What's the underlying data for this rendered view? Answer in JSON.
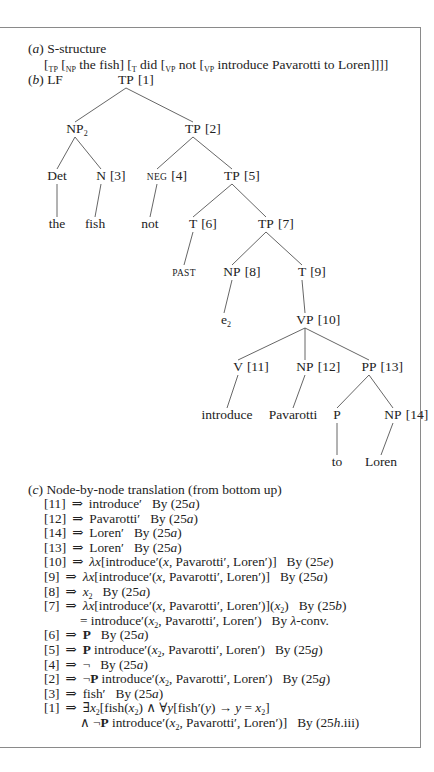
{
  "section_a": {
    "label": "(a)",
    "title": "S-structure",
    "bracketing": {
      "open_tp": "[",
      "tp_label": "TP",
      "np_label": "NP",
      "np_text": "the fish]",
      "t_label": "T",
      "t_text": "did",
      "vp1_label": "VP",
      "vp1_text": "not",
      "vp2_label": "VP",
      "vp2_text": "introduce Pavarotti to Loren]]]]"
    }
  },
  "section_b": {
    "label": "(b)",
    "title": "LF",
    "tree": {
      "nodes": [
        {
          "id": "tp1",
          "cat": "TP",
          "idx": "[1]",
          "x": 126,
          "y": 72
        },
        {
          "id": "np2",
          "cat": "NP",
          "sub": "2",
          "idx": "",
          "x": 75,
          "y": 121
        },
        {
          "id": "tp2",
          "cat": "TP",
          "idx": "[2]",
          "x": 193,
          "y": 121
        },
        {
          "id": "det",
          "cat": "Det",
          "idx": "",
          "x": 57,
          "y": 168
        },
        {
          "id": "n3",
          "cat": "N",
          "idx": "[3]",
          "x": 101,
          "y": 168
        },
        {
          "id": "neg4",
          "cat": "NEG",
          "idx": "[4]",
          "x": 157,
          "y": 168,
          "smallcaps": true
        },
        {
          "id": "tp5",
          "cat": "TP",
          "idx": "[5]",
          "x": 232,
          "y": 168
        },
        {
          "id": "the",
          "cat": "the",
          "idx": "",
          "x": 57,
          "y": 216
        },
        {
          "id": "fish",
          "cat": "fish",
          "idx": "",
          "x": 95,
          "y": 216
        },
        {
          "id": "not",
          "cat": "not",
          "idx": "",
          "x": 150,
          "y": 216
        },
        {
          "id": "t6",
          "cat": "T",
          "idx": "[6]",
          "x": 193,
          "y": 216
        },
        {
          "id": "tp7",
          "cat": "TP",
          "idx": "[7]",
          "x": 266,
          "y": 216
        },
        {
          "id": "past",
          "cat": "PAST",
          "idx": "",
          "x": 184,
          "y": 264,
          "smallcaps": true
        },
        {
          "id": "np8",
          "cat": "NP",
          "idx": "[8]",
          "x": 232,
          "y": 264
        },
        {
          "id": "t9",
          "cat": "T",
          "idx": "[9]",
          "x": 302,
          "y": 264
        },
        {
          "id": "e2",
          "cat": "e",
          "sub": "2",
          "idx": "",
          "x": 224,
          "y": 312
        },
        {
          "id": "vp10",
          "cat": "VP",
          "idx": "[10]",
          "x": 305,
          "y": 312
        },
        {
          "id": "v11",
          "cat": "V",
          "idx": "[11]",
          "x": 238,
          "y": 359
        },
        {
          "id": "np12",
          "cat": "NP",
          "idx": "[12]",
          "x": 305,
          "y": 359
        },
        {
          "id": "pp13",
          "cat": "PP",
          "idx": "[13]",
          "x": 369,
          "y": 359
        },
        {
          "id": "introduce",
          "cat": "introduce",
          "idx": "",
          "x": 227,
          "y": 407
        },
        {
          "id": "pavarotti",
          "cat": "Pavarotti",
          "idx": "",
          "x": 293,
          "y": 407
        },
        {
          "id": "p",
          "cat": "P",
          "idx": "",
          "x": 337,
          "y": 407
        },
        {
          "id": "np14",
          "cat": "NP",
          "idx": "[14]",
          "x": 393,
          "y": 407
        },
        {
          "id": "to",
          "cat": "to",
          "idx": "",
          "x": 337,
          "y": 454
        },
        {
          "id": "loren",
          "cat": "Loren",
          "idx": "",
          "x": 381,
          "y": 454
        }
      ],
      "edges": [
        [
          "tp1",
          "np2"
        ],
        [
          "tp1",
          "tp2"
        ],
        [
          "np2",
          "det"
        ],
        [
          "np2",
          "n3"
        ],
        [
          "tp2",
          "neg4"
        ],
        [
          "tp2",
          "tp5"
        ],
        [
          "det",
          "the"
        ],
        [
          "n3",
          "fish"
        ],
        [
          "neg4",
          "not"
        ],
        [
          "tp5",
          "t6"
        ],
        [
          "tp5",
          "tp7"
        ],
        [
          "t6",
          "past"
        ],
        [
          "tp7",
          "np8"
        ],
        [
          "tp7",
          "t9"
        ],
        [
          "np8",
          "e2"
        ],
        [
          "t9",
          "vp10"
        ],
        [
          "vp10",
          "v11"
        ],
        [
          "vp10",
          "np12"
        ],
        [
          "vp10",
          "pp13"
        ],
        [
          "v11",
          "introduce"
        ],
        [
          "np12",
          "pavarotti"
        ],
        [
          "pp13",
          "p"
        ],
        [
          "pp13",
          "np14"
        ],
        [
          "p",
          "to"
        ],
        [
          "np14",
          "loren"
        ]
      ]
    }
  },
  "section_c": {
    "label": "(c)",
    "title": "Node-by-node translation (from bottom up)",
    "arrow": "⇒",
    "rows": [
      {
        "node": "[11]",
        "expr": "introduce′",
        "by": "By (25a)"
      },
      {
        "node": "[12]",
        "expr": "Pavarotti′",
        "by": "By (25a)"
      },
      {
        "node": "[14]",
        "expr": "Loren′",
        "by": "By (25a)"
      },
      {
        "node": "[13]",
        "expr": "Loren′",
        "by": "By (25a)"
      },
      {
        "node": "[10]",
        "expr": "λx[introduce′(x, Pavarotti′, Loren′)]",
        "by": "By (25e)"
      },
      {
        "node": "[9]",
        "expr": "λx[introduce′(x, Pavarotti′, Loren′)]",
        "by": "By (25a)"
      },
      {
        "node": "[8]",
        "expr": "x₂",
        "by": "By (25a)"
      },
      {
        "node": "[7]",
        "expr": "λx[introduce′(x, Pavarotti′, Loren′)](x₂)",
        "by": "By (25b)"
      },
      {
        "node": "",
        "expr": "= introduce′(x₂, Pavarotti′, Loren′)",
        "by": "By λ-conv.",
        "continuation": true
      },
      {
        "node": "[6]",
        "expr": "P",
        "by": "By (25a)"
      },
      {
        "node": "[5]",
        "expr": "P introduce′(x₂, Pavarotti′, Loren′)",
        "by": "By (25g)"
      },
      {
        "node": "[4]",
        "expr": "¬",
        "by": "By (25a)"
      },
      {
        "node": "[2]",
        "expr": "¬P introduce′(x₂, Pavarotti′, Loren′)",
        "by": "By (25g)"
      },
      {
        "node": "[3]",
        "expr": "fish′",
        "by": "By (25a)"
      },
      {
        "node": "[1]",
        "expr": "∃x₂[fish(x₂) ∧ ∀y[fish′(y) → y = x₂]",
        "by": ""
      },
      {
        "node": "",
        "expr": "∧ ¬P introduce′(x₂, Pavarotti′, Loren′)]",
        "by": "By (25h.iii)",
        "continuation": true
      }
    ]
  }
}
